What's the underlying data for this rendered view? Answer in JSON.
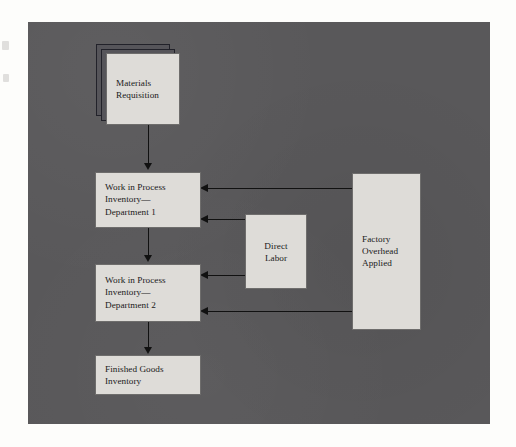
{
  "diagram": {
    "type": "flow-diagram",
    "panel_color": "#59585a",
    "node_fill": "#dedcd8",
    "node_border": "#6e6d6c",
    "connector_color": "#111111",
    "nodes": [
      {
        "id": "materials-requisition",
        "label": "Materials\nRequisition",
        "align": "left",
        "stacked": true,
        "x": 106,
        "y": 53,
        "w": 74,
        "h": 72
      },
      {
        "id": "wip-department-1",
        "label": "Work in Process\nInventory—\nDepartment 1",
        "align": "left",
        "stacked": false,
        "x": 95,
        "y": 172,
        "w": 106,
        "h": 56
      },
      {
        "id": "wip-department-2",
        "label": "Work in Process\nInventory—\nDepartment 2",
        "align": "left",
        "stacked": false,
        "x": 95,
        "y": 264,
        "w": 106,
        "h": 58
      },
      {
        "id": "finished-goods-inventory",
        "label": "Finished Goods\nInventory",
        "align": "left",
        "stacked": false,
        "x": 95,
        "y": 355,
        "w": 106,
        "h": 40
      },
      {
        "id": "direct-labor",
        "label": "Direct\nLabor",
        "align": "center",
        "stacked": false,
        "x": 245,
        "y": 214,
        "w": 62,
        "h": 75
      },
      {
        "id": "factory-overhead-applied",
        "label": "Factory\nOverhead\nApplied",
        "align": "left",
        "stacked": false,
        "x": 352,
        "y": 173,
        "w": 69,
        "h": 157
      }
    ],
    "connections": [
      {
        "id": "materials-to-wip1",
        "from": "materials-requisition",
        "to": "wip-department-1",
        "direction": "down"
      },
      {
        "id": "wip1-to-wip2",
        "from": "wip-department-1",
        "to": "wip-department-2",
        "direction": "down"
      },
      {
        "id": "wip2-to-finished-goods",
        "from": "wip-department-2",
        "to": "finished-goods-inventory",
        "direction": "down"
      },
      {
        "id": "overhead-to-wip1",
        "from": "factory-overhead-applied",
        "to": "wip-department-1",
        "direction": "left"
      },
      {
        "id": "labor-to-wip1",
        "from": "direct-labor",
        "to": "wip-department-1",
        "direction": "left"
      },
      {
        "id": "labor-to-wip2",
        "from": "direct-labor",
        "to": "wip-department-2",
        "direction": "left"
      },
      {
        "id": "overhead-to-wip2",
        "from": "factory-overhead-applied",
        "to": "wip-department-2",
        "direction": "left"
      }
    ]
  }
}
